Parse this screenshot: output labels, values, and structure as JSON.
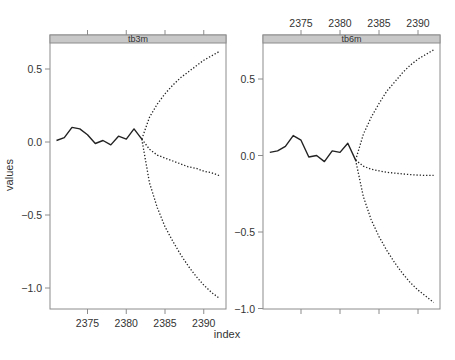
{
  "chart_data": {
    "type": "line",
    "layout": "lattice 2 panels side by side",
    "xlabel": "index",
    "ylabel": "values",
    "grid": false,
    "legend": null,
    "panels": [
      {
        "strip": "tb3m",
        "xlim": [
          2370.3,
          2392.8
        ],
        "ylim": [
          -1.15,
          0.7
        ],
        "x_ticks": [
          2375,
          2380,
          2385,
          2390
        ],
        "y_ticks": [
          -1.0,
          -0.5,
          0.0,
          0.5
        ],
        "y_tick_labels": [
          "−1.0",
          "−0.5",
          "0.0",
          "0.5"
        ],
        "x_tick_labels_side": "bottom",
        "y_tick_labels_side": "left",
        "series": [
          {
            "name": "observed",
            "style": "solid",
            "x": [
              2371,
              2372,
              2373,
              2374,
              2375,
              2376,
              2377,
              2378,
              2379,
              2380,
              2381,
              2382
            ],
            "y": [
              0.01,
              0.03,
              0.1,
              0.09,
              0.05,
              -0.01,
              0.01,
              -0.02,
              0.04,
              0.02,
              0.09,
              0.02
            ]
          },
          {
            "name": "forecast-upper",
            "style": "dotted",
            "x": [
              2382,
              2383,
              2384,
              2385,
              2386,
              2387,
              2388,
              2389,
              2390,
              2391,
              2392
            ],
            "y": [
              0.02,
              0.17,
              0.26,
              0.33,
              0.39,
              0.44,
              0.48,
              0.52,
              0.56,
              0.59,
              0.62
            ]
          },
          {
            "name": "forecast-mean",
            "style": "dotted",
            "x": [
              2382,
              2383,
              2384,
              2385,
              2386,
              2387,
              2388,
              2389,
              2390,
              2391,
              2392
            ],
            "y": [
              0.02,
              -0.05,
              -0.09,
              -0.11,
              -0.13,
              -0.15,
              -0.17,
              -0.18,
              -0.2,
              -0.21,
              -0.23
            ]
          },
          {
            "name": "forecast-lower",
            "style": "dotted",
            "x": [
              2382,
              2383,
              2384,
              2385,
              2386,
              2387,
              2388,
              2389,
              2390,
              2391,
              2392
            ],
            "y": [
              0.02,
              -0.28,
              -0.45,
              -0.58,
              -0.68,
              -0.77,
              -0.85,
              -0.92,
              -0.98,
              -1.03,
              -1.07
            ]
          }
        ]
      },
      {
        "strip": "tb6m",
        "xlim": [
          2370.3,
          2392.8
        ],
        "ylim": [
          -1.0,
          0.75
        ],
        "x_ticks": [
          2375,
          2380,
          2385,
          2390
        ],
        "y_ticks": [
          -1.0,
          -0.5,
          0.0,
          0.5
        ],
        "y_tick_labels": [
          "−1.0",
          "−0.5",
          "0.0",
          "0.5"
        ],
        "x_tick_labels_side": "top",
        "y_tick_labels_side": "left",
        "series": [
          {
            "name": "observed",
            "style": "solid",
            "x": [
              2371,
              2372,
              2373,
              2374,
              2375,
              2376,
              2377,
              2378,
              2379,
              2380,
              2381,
              2382
            ],
            "y": [
              0.02,
              0.03,
              0.06,
              0.13,
              0.1,
              -0.01,
              0.0,
              -0.04,
              0.03,
              0.02,
              0.08,
              -0.03
            ]
          },
          {
            "name": "forecast-upper",
            "style": "dotted",
            "x": [
              2382,
              2383,
              2384,
              2385,
              2386,
              2387,
              2388,
              2389,
              2390,
              2391,
              2392
            ],
            "y": [
              -0.03,
              0.14,
              0.25,
              0.34,
              0.42,
              0.48,
              0.54,
              0.59,
              0.63,
              0.66,
              0.69
            ]
          },
          {
            "name": "forecast-mean",
            "style": "dotted",
            "x": [
              2382,
              2383,
              2384,
              2385,
              2386,
              2387,
              2388,
              2389,
              2390,
              2391,
              2392
            ],
            "y": [
              -0.03,
              -0.07,
              -0.09,
              -0.1,
              -0.11,
              -0.115,
              -0.12,
              -0.125,
              -0.128,
              -0.13,
              -0.13
            ]
          },
          {
            "name": "forecast-lower",
            "style": "dotted",
            "x": [
              2382,
              2383,
              2384,
              2385,
              2386,
              2387,
              2388,
              2389,
              2390,
              2391,
              2392
            ],
            "y": [
              -0.03,
              -0.27,
              -0.42,
              -0.53,
              -0.62,
              -0.7,
              -0.77,
              -0.83,
              -0.88,
              -0.92,
              -0.96
            ]
          }
        ]
      }
    ]
  },
  "colors": {
    "strip_fill": "#c8c8c8",
    "strip_border": "#8c8c8c",
    "panel_border": "#8c8c8c",
    "line": "#222222",
    "text": "#333333"
  }
}
